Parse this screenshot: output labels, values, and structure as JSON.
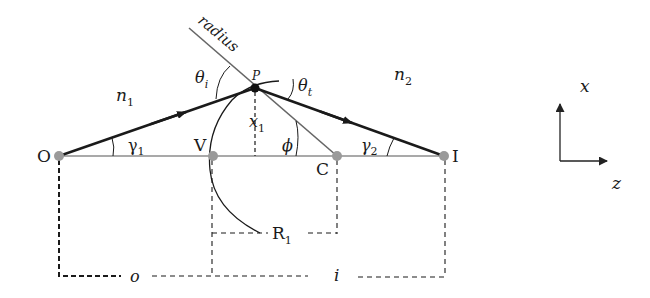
{
  "diagram": {
    "points": {
      "O": {
        "label": "O",
        "x": 59,
        "y": 156
      },
      "V": {
        "label": "V",
        "x": 213,
        "y": 156
      },
      "C": {
        "label": "C",
        "x": 337,
        "y": 156
      },
      "I": {
        "label": "I",
        "x": 444,
        "y": 156
      },
      "P": {
        "label": "P",
        "x": 255,
        "y": 88
      }
    },
    "labels": {
      "radius": "radius",
      "n1": "n",
      "n1_sub": "1",
      "n2": "n",
      "n2_sub": "2",
      "theta_i": "θ",
      "theta_i_sub": "i",
      "theta_t": "θ",
      "theta_t_sub": "t",
      "x1": "x",
      "x1_sub": "1",
      "phi": "ϕ",
      "gamma1": "γ",
      "gamma1_sub": "1",
      "gamma2": "γ",
      "gamma2_sub": "2",
      "R1": "R",
      "R1_sub": "1",
      "o": "o",
      "i": "i"
    },
    "axes_icon": {
      "x_label": "x",
      "z_label": "z"
    },
    "colors": {
      "ray": "#1a1a1a",
      "axis": "#555555",
      "radius_line": "#666666",
      "point_dot": "#9a9a9a",
      "dashed": "#1a1a1a"
    }
  }
}
